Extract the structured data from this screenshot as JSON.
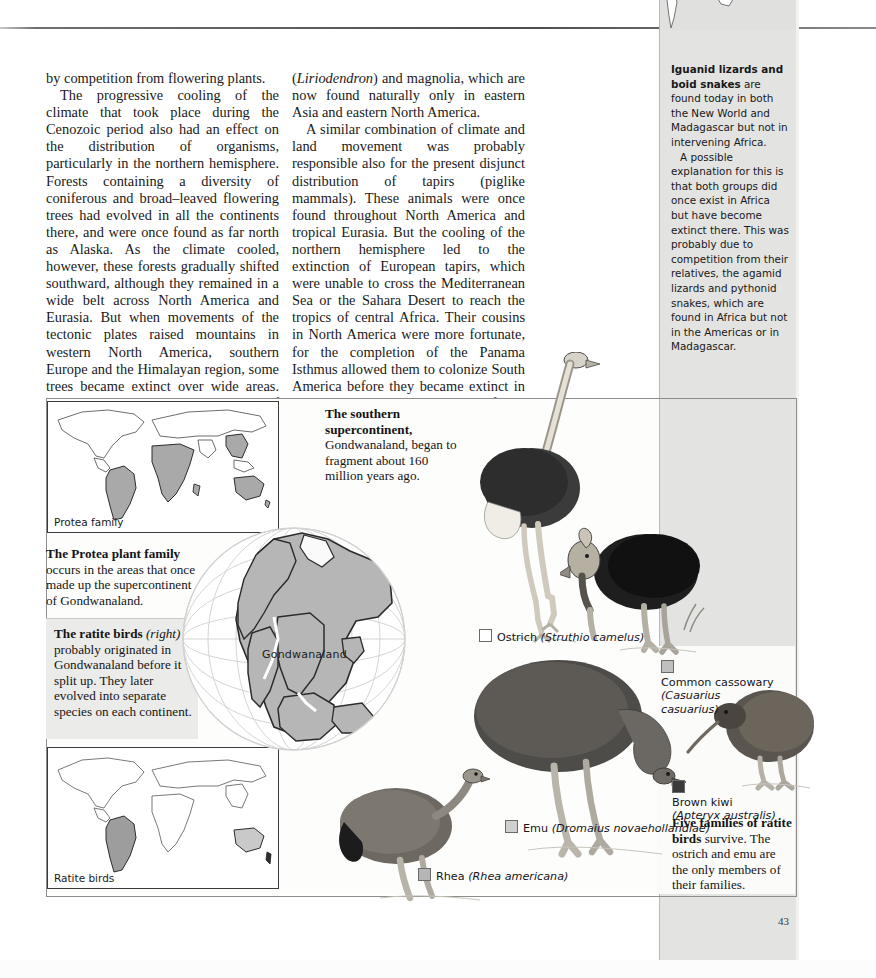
{
  "page": {
    "number": "43"
  },
  "body": {
    "column1": [
      "by competition from flowering plants.",
      "The progressive cooling of the climate that took place during the Cenozoic period also had an effect on the distribution of organisms, particularly in the northern hemisphere. Forests containing a diversity of coniferous and broad-leaved flowering trees had evolved in all the continents there, and were once found as far north as Alaska. As the climate cooled, however, these forests gradually shifted southward, although they remained in a wide belt across North America and Eurasia. But when movements of the tectonic plates raised mountains in western North America, southern Europe and the Himalayan region, some trees became extinct over wide areas. Hence the irregular distribution today of the sweet chestnut tree (Castanea), the tulip tree"
    ],
    "column2": [
      "(Liriodendron) and magnolia, which are now found naturally only in eastern Asia and eastern North America.",
      "A similar combination of climate and land movement was probably responsible also for the present disjunct distribution of tapirs (piglike mammals). These animals were once found throughout North America and tropical Eurasia. But the cooling of the northern hemisphere led to the extinction of European tapirs, which were unable to cross the Mediterranean Sea or the Sahara Desert to reach the tropics of central Africa. Their cousins in North America were more fortunate, for the completion of the Panama Isthmus allowed them to colonize South America before they became extinct in the north. So, today, tapirs are found only in South America and Southeast Asia."
    ]
  },
  "sidebar_note": {
    "lead": "Iguanid lizards and boid snakes",
    "para1_rest": " are found today in both the New World and Madagascar but not in intervening Africa.",
    "para2": "A possible explanation for this is that both groups did once exist in Africa but have become extinct there. This was probably due to competition from their relatives, the agamid lizards and pythonid snakes, which are found in Africa but not in the Americas or in Madagascar."
  },
  "figure": {
    "maps": [
      {
        "id": "protea",
        "label": "Protea family"
      },
      {
        "id": "ratite",
        "label": "Ratite birds"
      }
    ],
    "globe": {
      "label": "Gondwanaland"
    },
    "captions": {
      "protea": {
        "lead": "The Protea plant family",
        "rest": " occurs in the areas that once made up the supercontinent of Gondwanaland."
      },
      "ratite": {
        "lead": "The ratite birds",
        "italic": "(right)",
        "rest": " probably originated in Gondwanaland before it split up. They later evolved into separate species on each continent."
      },
      "supercontinent": {
        "lead": "The southern supercontinent,",
        "rest": " Gondwanaland, began to fragment about 160 million years ago."
      },
      "five_families": {
        "lead": "Five families of ratite birds",
        "rest": " survive. The ostrich and emu are the only members of their families."
      }
    },
    "legend": [
      {
        "common": "Ostrich",
        "latin": "(Struthio camelus)",
        "swatch": "#ffffff",
        "two_line": false
      },
      {
        "common": "Common cassowary",
        "latin": "(Casuarius casuarius)",
        "swatch": "#bfbfbf",
        "two_line": true
      },
      {
        "common": "Brown kiwi",
        "latin": "(Apteryx australis)",
        "swatch": "#3a3a3a",
        "two_line": true
      },
      {
        "common": "Emu",
        "latin": "(Dromaius novaehollandiae)",
        "swatch": "#cfcfcf",
        "two_line": false
      },
      {
        "common": "Rhea",
        "latin": "(Rhea americana)",
        "swatch": "#b5b5b5",
        "two_line": false
      }
    ]
  },
  "colors": {
    "band": "#e3e3e1",
    "map_fill": "#a8a8a8",
    "rule": "#4d4d4d"
  }
}
